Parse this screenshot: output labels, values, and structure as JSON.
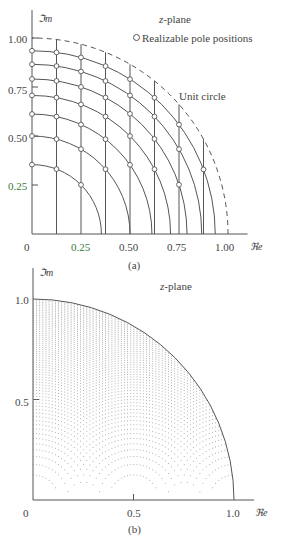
{
  "figure_a": {
    "caption": "(a)",
    "plane_label": "z-plane",
    "legend": "Realizable pole positions",
    "unit_circle_label": "Unit circle",
    "y_axis_label": "ℑm",
    "x_axis_label": "ℜe",
    "y_ticks": [
      "1.00",
      "0.75",
      "0.50",
      "0.25"
    ],
    "x_ticks": [
      "0",
      "0.25",
      "0.50",
      "0.75",
      "1.00"
    ],
    "origin_px": [
      32,
      234
    ],
    "scale_px": 196
  },
  "figure_b": {
    "caption": "(b)",
    "plane_label": "z-plane",
    "y_axis_label": "ℑm",
    "x_axis_label": "ℜe",
    "y_ticks": [
      "1.0",
      "0.5"
    ],
    "x_ticks": [
      "0",
      "0.5",
      "1.0"
    ],
    "origin_px": [
      33,
      500
    ],
    "scale_px": 201
  },
  "chart_data": [
    {
      "type": "scatter",
      "title": "z-plane (a)",
      "description": "Realizable pole positions for direct-form second-order section with 3-bit coefficient quantization: vertical lines at Re = k/8, circles at radius sqrt(k/8)",
      "xlabel": "Re",
      "ylabel": "Im",
      "xlim": [
        0,
        1.0
      ],
      "ylim": [
        0,
        1.0
      ],
      "vertical_lines_re": [
        0.125,
        0.25,
        0.375,
        0.5,
        0.625,
        0.75,
        0.875
      ],
      "circle_radii": [
        0.354,
        0.5,
        0.612,
        0.707,
        0.791,
        0.866,
        0.935
      ],
      "unit_circle": {
        "radius": 1.0,
        "style": "dashed"
      },
      "legend": [
        "Realizable pole positions"
      ],
      "annotations": [
        "z-plane",
        "Unit circle"
      ]
    },
    {
      "type": "scatter",
      "title": "z-plane (b)",
      "description": "Dense grid of realizable pole positions inside the unit circle (finer coefficient quantization)",
      "xlabel": "Re",
      "ylabel": "Im",
      "xlim": [
        0,
        1.0
      ],
      "ylim": [
        0,
        1.0
      ],
      "re_step": 0.015625,
      "r_squared_step": 0.015625,
      "unit_circle": {
        "radius": 1.0,
        "style": "solid"
      }
    }
  ]
}
